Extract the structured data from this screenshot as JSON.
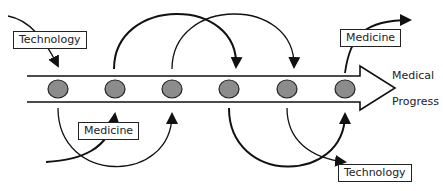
{
  "diagram": {
    "main_arrow": {
      "label_line1": "Medical",
      "label_line2": "Progress",
      "stage_count": 6
    },
    "labels": {
      "technology_top_left": "Technology",
      "medicine_bottom_left": "Medicine",
      "medicine_top_right": "Medicine",
      "technology_bottom_right": "Technology"
    },
    "colors": {
      "stroke": "#111111",
      "node_fill": "#8c8c8c",
      "background": "#ffffff"
    }
  }
}
